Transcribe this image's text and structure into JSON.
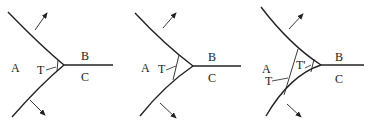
{
  "figure": {
    "panels": [
      {
        "id": "panel-1",
        "labels": {
          "a": "A",
          "b": "B",
          "c": "C",
          "t": "T"
        }
      },
      {
        "id": "panel-2",
        "labels": {
          "a": "A",
          "b": "B",
          "c": "C",
          "t": "T"
        }
      },
      {
        "id": "panel-3",
        "labels": {
          "a": "A",
          "b": "B",
          "c": "C",
          "t": "T",
          "t_prime": "T'"
        }
      }
    ],
    "colors": {
      "line": "#222222",
      "background": "#ffffff"
    }
  }
}
